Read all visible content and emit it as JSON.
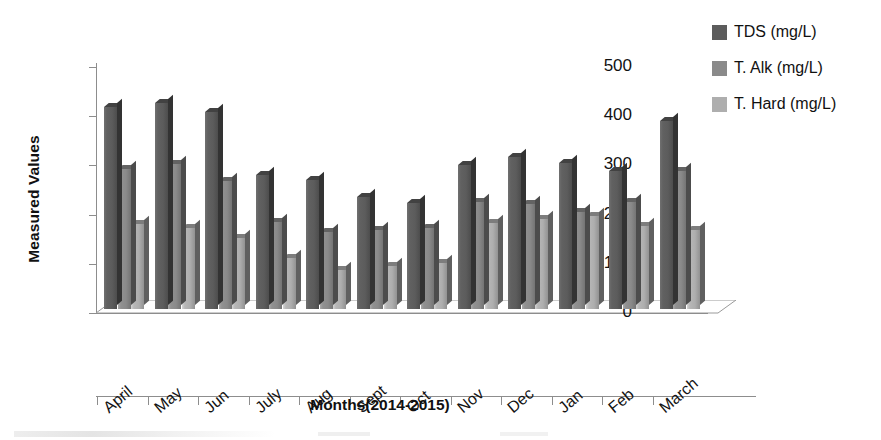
{
  "chart_data": {
    "type": "bar",
    "title": "",
    "xlabel": "Months(2014-2015)",
    "ylabel": "Measured Values",
    "categories": [
      "April",
      "May",
      "Jun",
      "July",
      "Aug",
      "Sept",
      "Oct",
      "Nov",
      "Dec",
      "Jan",
      "Feb",
      "March"
    ],
    "series": [
      {
        "name": "TDS (mg/L)",
        "color": "#5c5c5c",
        "values": [
          410,
          418,
          400,
          273,
          263,
          228,
          215,
          293,
          308,
          297,
          280,
          382
        ]
      },
      {
        "name": "T. Alk (mg/L)",
        "color": "#8a8a8a",
        "values": [
          285,
          295,
          260,
          177,
          157,
          160,
          165,
          218,
          213,
          198,
          217,
          280
        ]
      },
      {
        "name": "T. Hard (mg/L)",
        "color": "#aeaeae",
        "values": [
          172,
          165,
          145,
          103,
          80,
          88,
          93,
          175,
          182,
          190,
          168,
          160
        ]
      }
    ],
    "ylim": [
      0,
      500
    ],
    "yticks": [
      0,
      100,
      200,
      300,
      400,
      500
    ],
    "ytick_labels": [
      "0",
      "100",
      "200",
      "300",
      "400",
      "500"
    ],
    "grid": false,
    "legend_position": "right-top",
    "three_d": true
  },
  "legend": {
    "items": [
      {
        "label": "TDS (mg/L)",
        "color": "#5c5c5c"
      },
      {
        "label": "T. Alk (mg/L)",
        "color": "#8a8a8a"
      },
      {
        "label": "T. Hard (mg/L)",
        "color": "#aeaeae"
      }
    ]
  },
  "axes": {
    "x_title": "Months(2014-2015)",
    "y_title": "Measured Values"
  }
}
